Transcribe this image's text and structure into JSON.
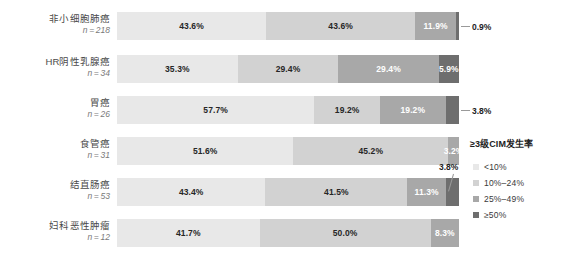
{
  "chart_data": {
    "type": "bar",
    "subtype": "100% stacked horizontal bar",
    "title": "",
    "xlabel": "",
    "ylabel": "",
    "xlim": [
      0,
      100
    ],
    "grid": false,
    "legend_position": "right",
    "legend_title": "≥3级CIM发生率",
    "categories": [
      "非小细胞肺癌",
      "HR阴性乳腺癌",
      "胃癌",
      "食管癌",
      "结直肠癌",
      "妇科恶性肿瘤"
    ],
    "category_counts": [
      "n = 218",
      "n = 34",
      "n = 26",
      "n = 31",
      "n = 53",
      "n = 12"
    ],
    "series": [
      {
        "name": "<10%",
        "color": "#e8e8e8",
        "values": [
          43.6,
          35.3,
          57.7,
          51.6,
          43.4,
          41.7
        ]
      },
      {
        "name": "10%–24%",
        "color": "#d2d2d2",
        "values": [
          43.6,
          29.4,
          19.2,
          45.2,
          41.5,
          50.0
        ]
      },
      {
        "name": "25%–49%",
        "color": "#a8a8a8",
        "values": [
          11.9,
          29.4,
          19.2,
          3.2,
          11.3,
          8.3
        ]
      },
      {
        "name": "≥50%",
        "color": "#6e6e6e",
        "values": [
          0.9,
          5.9,
          3.8,
          0.0,
          3.8,
          0.0
        ]
      }
    ]
  },
  "rows": [
    {
      "label": "非小细胞肺癌",
      "n": "n = 218",
      "segments": [
        {
          "value": 43.6,
          "text": "43.6%",
          "color_class": "c0",
          "inside": true
        },
        {
          "value": 43.6,
          "text": "43.6%",
          "color_class": "c1",
          "inside": true
        },
        {
          "value": 11.9,
          "text": "11.9%",
          "color_class": "c2",
          "inside": true
        },
        {
          "value": 0.9,
          "text": "0.9%",
          "color_class": "c3",
          "inside": false
        }
      ]
    },
    {
      "label": "HR阴性乳腺癌",
      "n": "n = 34",
      "segments": [
        {
          "value": 35.3,
          "text": "35.3%",
          "color_class": "c0",
          "inside": true
        },
        {
          "value": 29.4,
          "text": "29.4%",
          "color_class": "c1",
          "inside": true
        },
        {
          "value": 29.4,
          "text": "29.4%",
          "color_class": "c2",
          "inside": true
        },
        {
          "value": 5.9,
          "text": "5.9%",
          "color_class": "c3",
          "inside": true
        }
      ]
    },
    {
      "label": "胃癌",
      "n": "n = 26",
      "segments": [
        {
          "value": 57.7,
          "text": "57.7%",
          "color_class": "c0",
          "inside": true
        },
        {
          "value": 19.2,
          "text": "19.2%",
          "color_class": "c1",
          "inside": true
        },
        {
          "value": 19.2,
          "text": "19.2%",
          "color_class": "c2",
          "inside": true
        },
        {
          "value": 3.8,
          "text": "3.8%",
          "color_class": "c3",
          "inside": false
        }
      ]
    },
    {
      "label": "食管癌",
      "n": "n = 31",
      "segments": [
        {
          "value": 51.6,
          "text": "51.6%",
          "color_class": "c0",
          "inside": true
        },
        {
          "value": 45.2,
          "text": "45.2%",
          "color_class": "c1",
          "inside": true
        },
        {
          "value": 3.2,
          "text": "3.2%",
          "color_class": "c2",
          "inside": true
        },
        {
          "value": 0.0,
          "text": "",
          "color_class": "c3",
          "inside": true
        }
      ]
    },
    {
      "label": "结直肠癌",
      "n": "n = 53",
      "segments": [
        {
          "value": 43.4,
          "text": "43.4%",
          "color_class": "c0",
          "inside": true
        },
        {
          "value": 41.5,
          "text": "41.5%",
          "color_class": "c1",
          "inside": true
        },
        {
          "value": 11.3,
          "text": "11.3%",
          "color_class": "c2",
          "inside": true
        },
        {
          "value": 3.8,
          "text": "3.8%",
          "color_class": "c3",
          "inside": false
        }
      ]
    },
    {
      "label": "妇科恶性肿瘤",
      "n": "n = 12",
      "segments": [
        {
          "value": 41.7,
          "text": "41.7%",
          "color_class": "c0",
          "inside": true
        },
        {
          "value": 50.0,
          "text": "50.0%",
          "color_class": "c1",
          "inside": true
        },
        {
          "value": 8.3,
          "text": "8.3%",
          "color_class": "c2",
          "inside": true
        },
        {
          "value": 0.0,
          "text": "",
          "color_class": "c3",
          "inside": true
        }
      ]
    }
  ],
  "legend": {
    "title": "≥3级CIM发生率",
    "items": [
      {
        "label": "<10%",
        "color_class": "c0",
        "color": "#e8e8e8"
      },
      {
        "label": "10%–24%",
        "color_class": "c1",
        "color": "#d2d2d2"
      },
      {
        "label": "25%–49%",
        "color_class": "c2",
        "color": "#a8a8a8"
      },
      {
        "label": "≥50%",
        "color_class": "c3",
        "color": "#6e6e6e"
      }
    ]
  }
}
